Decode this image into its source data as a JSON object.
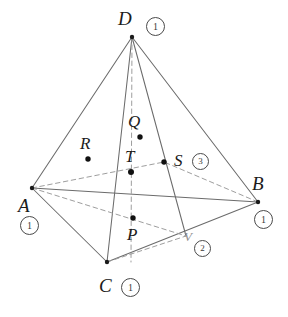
{
  "figure": {
    "type": "geometry-diagram",
    "shape": "tetrahedron",
    "canvas": {
      "width": 288,
      "height": 317
    },
    "stroke": {
      "solid": "#6b6b6b",
      "dashed": "#9a9a9a",
      "dot": "#1b1b1b"
    },
    "vertices": [
      {
        "id": "D",
        "label": "D",
        "x": 132,
        "y": 37,
        "badge": "1",
        "label_dx": -14,
        "label_dy": -28,
        "badge_dx": 14,
        "badge_dy": -20
      },
      {
        "id": "A",
        "label": "A",
        "x": 32,
        "y": 188,
        "badge": "1",
        "label_dx": -14,
        "label_dy": 8,
        "badge_dx": -12,
        "badge_dy": 28
      },
      {
        "id": "B",
        "label": "B",
        "x": 258,
        "y": 202,
        "badge": "1",
        "label_dx": -6,
        "label_dy": -28,
        "badge_dx": -4,
        "badge_dy": 8
      },
      {
        "id": "C",
        "label": "C",
        "x": 107,
        "y": 262,
        "badge": "1",
        "label_dx": -8,
        "label_dy": 14,
        "badge_dx": 14,
        "badge_dy": 16
      }
    ],
    "points": [
      {
        "id": "Q",
        "label": "Q",
        "x": 140,
        "y": 137,
        "badge": null,
        "label_dx": -12,
        "label_dy": -24
      },
      {
        "id": "R",
        "label": "R",
        "x": 88,
        "y": 159,
        "badge": null,
        "label_dx": -8,
        "label_dy": -24
      },
      {
        "id": "T",
        "label": "T",
        "x": 131,
        "y": 172,
        "badge": null,
        "label_dx": -6,
        "label_dy": -24
      },
      {
        "id": "S",
        "label": "S",
        "x": 164,
        "y": 162,
        "badge": "3",
        "label_dx": 10,
        "label_dy": -10,
        "badge_dx": 28,
        "badge_dy": -9
      },
      {
        "id": "P",
        "label": "P",
        "x": 133,
        "y": 218,
        "badge": null,
        "label_dx": -6,
        "label_dy": 8
      },
      {
        "id": "V",
        "label": "V",
        "x": 186,
        "y": 236,
        "badge": "2",
        "faint": true,
        "label_dx": -2,
        "label_dy": -6,
        "badge_dx": 8,
        "badge_dy": 4
      }
    ],
    "edges_solid": [
      {
        "name": "edge-D-A",
        "from": "D",
        "to": "A"
      },
      {
        "name": "edge-D-B",
        "from": "D",
        "to": "B"
      },
      {
        "name": "edge-D-C",
        "from": "D",
        "to": "C"
      },
      {
        "name": "edge-A-B",
        "from": "A",
        "to": "B"
      },
      {
        "name": "edge-A-C",
        "from": "A",
        "to": "C"
      },
      {
        "name": "edge-C-B",
        "from": "C",
        "to": "B"
      },
      {
        "name": "cevian-D-V",
        "from": "D",
        "to": "V"
      }
    ],
    "edges_dashed": [
      {
        "name": "hidden-edge-A-Bback",
        "x1": 32,
        "y1": 188,
        "x2": 258,
        "y2": 202,
        "via_x": 145,
        "via_y": 168
      },
      {
        "name": "hidden-edge-D-median",
        "x1": 132,
        "y1": 37,
        "x2": 131,
        "y2": 262
      },
      {
        "name": "cevian-A-V",
        "from": "A",
        "to": "V"
      },
      {
        "name": "hidden-edge-C-back",
        "x1": 107,
        "y1": 262,
        "x2": 186,
        "y2": 236
      }
    ]
  },
  "labels": {
    "D": "D",
    "A": "A",
    "B": "B",
    "C": "C",
    "Q": "Q",
    "R": "R",
    "T": "T",
    "S": "S",
    "P": "P",
    "V": "V"
  },
  "badges": {
    "D": "1",
    "A": "1",
    "B": "1",
    "C": "1",
    "S": "3",
    "V": "2"
  }
}
